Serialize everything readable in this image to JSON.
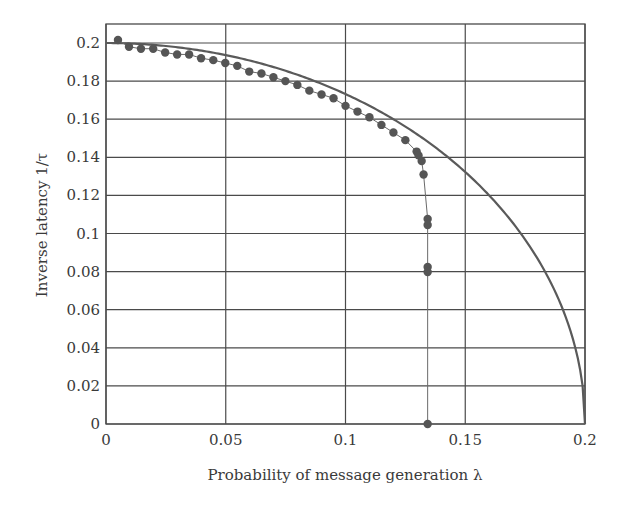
{
  "chart_data": {
    "type": "line",
    "title": "",
    "xlabel": "Probability of message generation λ",
    "ylabel": "Inverse latency 1/τ",
    "xlim": [
      0,
      0.2
    ],
    "ylim": [
      0,
      0.21
    ],
    "grid": true,
    "legend": null,
    "x_ticks": [
      "0",
      "0.05",
      "0.1",
      "0.15",
      "0.2"
    ],
    "x_tick_values": [
      0,
      0.05,
      0.1,
      0.15,
      0.2
    ],
    "y_ticks": [
      "0",
      "0.02",
      "0.04",
      "0.06",
      "0.08",
      "0.1",
      "0.12",
      "0.14",
      "0.16",
      "0.18",
      "0.2"
    ],
    "y_tick_values": [
      0,
      0.02,
      0.04,
      0.06,
      0.08,
      0.1,
      0.12,
      0.14,
      0.16,
      0.18,
      0.2
    ],
    "series": [
      {
        "name": "theory",
        "style": "thick-line",
        "color": "#5a5a5a",
        "description": "1/τ = sqrt(0.04 − λ²)",
        "x": [
          0,
          0.02,
          0.04,
          0.06,
          0.08,
          0.1,
          0.12,
          0.14,
          0.15,
          0.16,
          0.17,
          0.18,
          0.19,
          0.195,
          0.2
        ],
        "values": [
          0.2,
          0.199,
          0.196,
          0.1908,
          0.1833,
          0.1732,
          0.16,
          0.1428,
          0.1323,
          0.12,
          0.1054,
          0.0872,
          0.0624,
          0.0444,
          0
        ]
      },
      {
        "name": "simulation",
        "style": "markers-with-thin-line",
        "color": "#555555",
        "x": [
          0.005,
          0.0096,
          0.0146,
          0.0197,
          0.0247,
          0.0297,
          0.0347,
          0.0397,
          0.0448,
          0.0498,
          0.0548,
          0.0598,
          0.0649,
          0.0699,
          0.0749,
          0.0799,
          0.0849,
          0.09,
          0.095,
          0.1,
          0.105,
          0.11,
          0.115,
          0.12,
          0.125,
          0.1297,
          0.1305,
          0.1318,
          0.1326,
          0.1343,
          0.1343,
          0.1343,
          0.1343,
          0.1343
        ],
        "values": [
          0.2016,
          0.198,
          0.197,
          0.197,
          0.195,
          0.194,
          0.194,
          0.192,
          0.191,
          0.1895,
          0.188,
          0.185,
          0.184,
          0.182,
          0.18,
          0.178,
          0.175,
          0.173,
          0.171,
          0.167,
          0.164,
          0.161,
          0.157,
          0.153,
          0.149,
          0.143,
          0.141,
          0.138,
          0.131,
          0.1076,
          0.1045,
          0.0824,
          0.0798,
          0.0
        ]
      }
    ]
  }
}
